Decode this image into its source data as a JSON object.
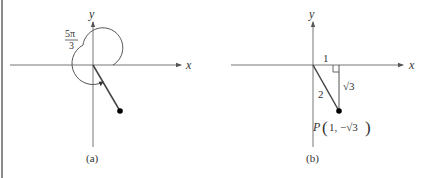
{
  "figure": {
    "panels": [
      {
        "id": "a",
        "caption": "(a)",
        "x_axis_label": "x",
        "y_axis_label": "y",
        "angle_label_numerator": "5π",
        "angle_label_denominator": "3",
        "angle": "5π/3",
        "point": "terminal point on ray in quadrant IV"
      },
      {
        "id": "b",
        "caption": "(b)",
        "x_axis_label": "x",
        "y_axis_label": "y",
        "horizontal_leg_label": "1",
        "vertical_leg_label": "√3",
        "hypotenuse_label": "2",
        "point_label_prefix": "P",
        "point_label_coords": "1, −√3",
        "point": "P(1, −√3)"
      }
    ],
    "colors": {
      "axis": "#666666",
      "line": "#444444",
      "point": "#000000",
      "text": "#333333",
      "border": "#8a8a8a"
    }
  }
}
